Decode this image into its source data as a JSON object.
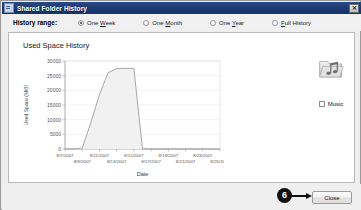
{
  "window": {
    "title": "Shared Folder History",
    "title_icon": "window-app-icon",
    "close_icon": "✕"
  },
  "range": {
    "label": "History range:",
    "options": [
      {
        "label_pre": "One ",
        "label_key": "W",
        "label_post": "eek",
        "selected": true
      },
      {
        "label_pre": "One ",
        "label_key": "M",
        "label_post": "onth",
        "selected": false
      },
      {
        "label_pre": "One ",
        "label_key": "Y",
        "label_post": "ear",
        "selected": false
      },
      {
        "label_pre": "",
        "label_key": "F",
        "label_post": "ull History",
        "selected": false
      }
    ]
  },
  "chart_data": {
    "type": "area",
    "title": "Used Space History",
    "xlabel": "Date",
    "ylabel": "Used Space (MiB)",
    "ylim": [
      0,
      30000
    ],
    "ytick_labels": [
      "30000",
      "25000",
      "20000",
      "15000",
      "10000",
      "5000",
      "0"
    ],
    "ytick_values": [
      30000,
      25000,
      20000,
      15000,
      10000,
      5000,
      0
    ],
    "xtick_labels": [
      "8/7/2007",
      "8/9/2007",
      "8/11/2007",
      "8/13/2007",
      "8/15/2007",
      "8/17/2007",
      "8/19/2007",
      "8/21/2007",
      "8/23/2007",
      "8/25/2007"
    ],
    "grid": true,
    "legend": "none",
    "series": [
      {
        "name": "Used Space (MiB)",
        "x": [
          "8/7/2007",
          "8/8/2007",
          "8/9/2007",
          "8/10/2007",
          "8/11/2007",
          "8/12/2007",
          "8/13/2007",
          "8/14/2007",
          "8/15/2007",
          "8/16/2007",
          "8/17/2007",
          "8/19/2007",
          "8/21/2007",
          "8/23/2007",
          "8/25/2007"
        ],
        "values": [
          0,
          0,
          300,
          9000,
          18500,
          26000,
          27400,
          27500,
          27500,
          0,
          0,
          0,
          0,
          0,
          0
        ]
      }
    ]
  },
  "folder": {
    "icon": "music-folder-icon",
    "checkbox_label": "Music",
    "checked": false
  },
  "footer": {
    "close_label": "Close"
  },
  "annotation": {
    "step_number": "6",
    "arrow_icon": "arrow-right-icon"
  }
}
